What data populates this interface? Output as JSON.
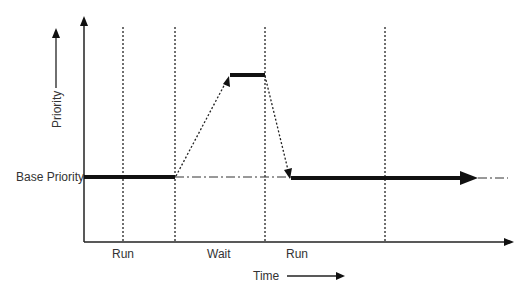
{
  "diagram": {
    "y_axis_label": "Priority",
    "x_axis_label": "Time",
    "base_label": "Base Priority",
    "phases": [
      {
        "label": "Run"
      },
      {
        "label": "Wait"
      },
      {
        "label": "Run"
      }
    ]
  }
}
